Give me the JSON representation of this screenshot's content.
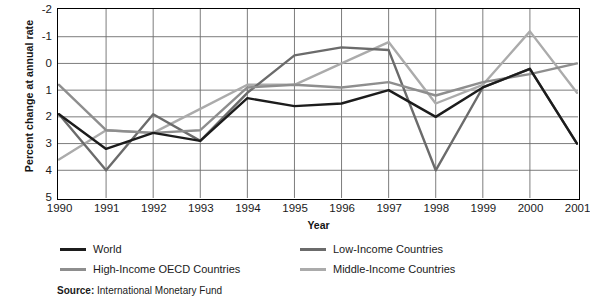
{
  "axes": {
    "ylabel": "Percent change at annual rate",
    "xlabel": "Year",
    "yticks": [
      "5",
      "4",
      "3",
      "2",
      "1",
      "0",
      "-1",
      "-2"
    ],
    "xticks": [
      "1990",
      "1991",
      "1992",
      "1993",
      "1994",
      "1995",
      "1996",
      "1997",
      "1998",
      "1999",
      "2000",
      "2001"
    ]
  },
  "legend": {
    "items": [
      {
        "label": "World",
        "color": "#1c1c1c"
      },
      {
        "label": "Low-Income Countries",
        "color": "#6b6b6b"
      },
      {
        "label": "High-Income OECD Countries",
        "color": "#8e8e8e"
      },
      {
        "label": "Middle-Income Countries",
        "color": "#ababab"
      }
    ]
  },
  "source": {
    "prefix": "Source:",
    "text": "International Monetary Fund"
  },
  "chart_data": {
    "type": "line",
    "title": "",
    "xlabel": "Year",
    "ylabel": "Percent change at annual rate",
    "ylim": [
      -2,
      5
    ],
    "yticks": [
      -2,
      -1,
      0,
      1,
      2,
      3,
      4,
      5
    ],
    "grid": true,
    "legend_position": "bottom",
    "x": [
      1990,
      1991,
      1992,
      1993,
      1994,
      1995,
      1996,
      1997,
      1998,
      1999,
      2000,
      2001
    ],
    "series": [
      {
        "name": "World",
        "color": "#1c1c1c",
        "values": [
          1.1,
          -0.2,
          0.4,
          0.1,
          1.7,
          1.4,
          1.5,
          2.0,
          1.0,
          2.1,
          2.8,
          0.0
        ]
      },
      {
        "name": "High-Income OECD Countries",
        "color": "#8e8e8e",
        "values": [
          2.2,
          0.5,
          0.4,
          0.5,
          2.1,
          2.2,
          2.1,
          2.3,
          1.8,
          2.3,
          2.6,
          3.0
        ]
      },
      {
        "name": "Low-Income Countries",
        "color": "#6b6b6b",
        "values": [
          1.1,
          -1.0,
          1.1,
          0.1,
          1.9,
          3.3,
          3.6,
          3.5,
          -1.0,
          2.1,
          2.8,
          0.0
        ]
      },
      {
        "name": "Middle-Income Countries",
        "color": "#ababab",
        "values": [
          -0.6,
          0.5,
          0.4,
          1.3,
          2.2,
          2.2,
          3.0,
          3.8,
          1.5,
          2.2,
          4.2,
          1.9
        ]
      }
    ]
  }
}
